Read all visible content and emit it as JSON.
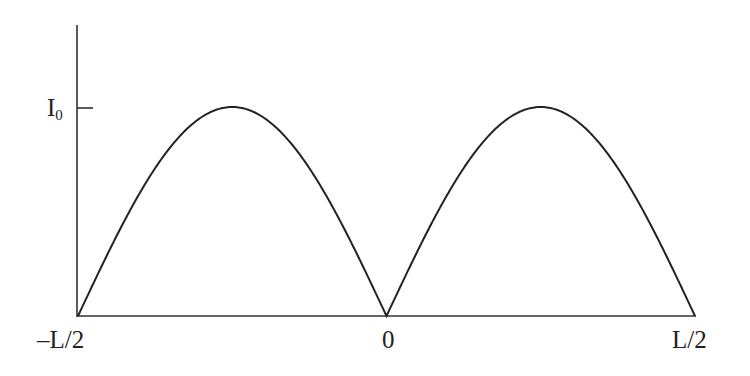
{
  "chart_data": {
    "type": "line",
    "title": "",
    "xlabel": "",
    "ylabel": "",
    "x_ticks": [
      "-L/2",
      "0",
      "L/2"
    ],
    "y_ticks": [
      "I0"
    ],
    "xlim": [
      -0.5,
      0.5
    ],
    "ylim": [
      0,
      1.35
    ],
    "grid": false,
    "legend": null,
    "series": [
      {
        "name": "current distribution",
        "description": "I(z) = I0 * |sin(2*pi*z/L)|, two arched lobes, zero at -L/2, 0 and L/2, peaks I0 at -L/4 and L/4",
        "x": [
          -0.5,
          -0.4375,
          -0.375,
          -0.3125,
          -0.25,
          -0.1875,
          -0.125,
          -0.0625,
          0,
          0.0625,
          0.125,
          0.1875,
          0.25,
          0.3125,
          0.375,
          0.4375,
          0.5
        ],
        "values": [
          0,
          0.383,
          0.707,
          0.924,
          1.0,
          0.924,
          0.707,
          0.383,
          0,
          0.383,
          0.707,
          0.924,
          1.0,
          0.924,
          0.707,
          0.383,
          0
        ]
      }
    ],
    "colors": {
      "axis": "#333333",
      "curve": "#222222"
    }
  },
  "labels": {
    "y_tick_main": "I",
    "y_tick_sub": "0",
    "x_left": "–L/2",
    "x_center": "0",
    "x_right": "L/2"
  }
}
